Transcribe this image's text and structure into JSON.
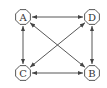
{
  "diagram": {
    "type": "directed-graph",
    "colors": {
      "stroke": "#444444",
      "node_fill": "#ffffff",
      "label": "#333333"
    },
    "nodes": [
      {
        "id": "A",
        "label": "A",
        "x": 23,
        "y": 17
      },
      {
        "id": "D",
        "label": "D",
        "x": 92,
        "y": 17
      },
      {
        "id": "C",
        "label": "C",
        "x": 23,
        "y": 73
      },
      {
        "id": "B",
        "label": "B",
        "x": 92,
        "y": 73
      }
    ],
    "edges": [
      {
        "from": "A",
        "to": "D",
        "bidirectional": true
      },
      {
        "from": "C",
        "to": "B",
        "bidirectional": true
      },
      {
        "from": "A",
        "to": "C",
        "bidirectional": true
      },
      {
        "from": "D",
        "to": "B",
        "bidirectional": true
      },
      {
        "from": "A",
        "to": "B",
        "bidirectional": true
      },
      {
        "from": "D",
        "to": "C",
        "bidirectional": true
      }
    ]
  }
}
